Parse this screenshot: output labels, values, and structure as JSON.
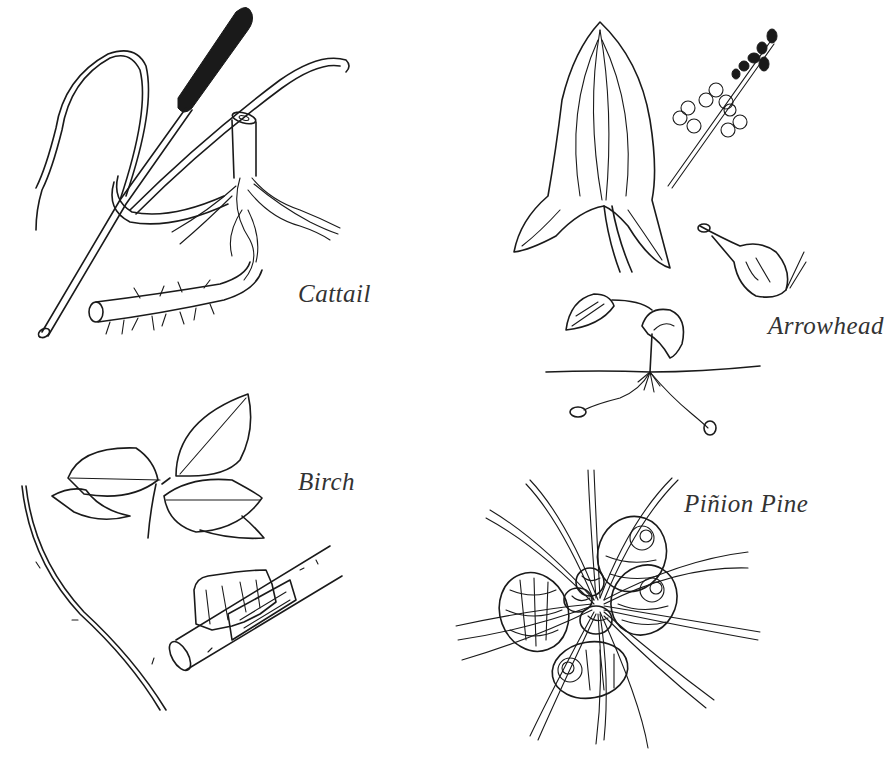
{
  "illustration": {
    "style": "black-and-white botanical line drawing",
    "ink_color": "#1a1a1a",
    "label_color": "#333333",
    "background": "#ffffff",
    "plants": [
      {
        "id": "cattail",
        "label": "Cattail",
        "parts": [
          "seed head",
          "leaves",
          "stalk",
          "rhizome with roots"
        ]
      },
      {
        "id": "arrowhead",
        "label": "Arrowhead",
        "parts": [
          "arrow-shaped leaf",
          "flower spike",
          "tuber",
          "seedling with runners"
        ]
      },
      {
        "id": "birch",
        "label": "Birch",
        "parts": [
          "leaf cluster",
          "twig with buds",
          "branch with peeling bark"
        ]
      },
      {
        "id": "pinion-pine",
        "label": "Piñion Pine",
        "parts": [
          "needle cluster",
          "pine cones"
        ]
      }
    ]
  }
}
